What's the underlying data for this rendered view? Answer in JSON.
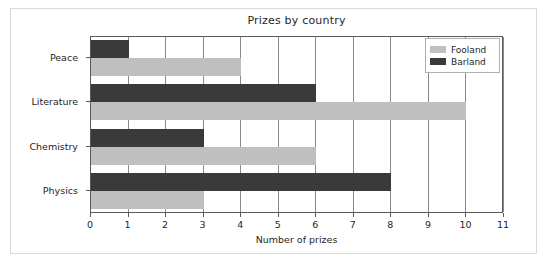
{
  "figure": {
    "title": "Prizes by country",
    "background_color": "#ffffff",
    "border_color": "#d9d9d9"
  },
  "legend": {
    "position": "upper right",
    "entries": [
      {
        "label": "Fooland",
        "color": "#bfbfbf"
      },
      {
        "label": "Barland",
        "color": "#3a3a3a"
      }
    ]
  },
  "axes": {
    "xlabel": "Number of prizes",
    "xticks": [
      "0",
      "1",
      "2",
      "3",
      "4",
      "5",
      "6",
      "7",
      "8",
      "9",
      "10",
      "11"
    ],
    "yticks": [
      "Peace",
      "Literature",
      "Chemistry",
      "Physics"
    ],
    "grid": "vertical",
    "gridline_color": "#8a8a8a",
    "spine_color": "#5a5a5a"
  },
  "chart_data": {
    "type": "bar",
    "orientation": "horizontal",
    "title": "Prizes by country",
    "xlabel": "Number of prizes",
    "ylabel": "",
    "categories": [
      "Peace",
      "Literature",
      "Chemistry",
      "Physics"
    ],
    "series": [
      {
        "name": "Fooland",
        "color": "#bfbfbf",
        "values": [
          4,
          10,
          6,
          3
        ]
      },
      {
        "name": "Barland",
        "color": "#3a3a3a",
        "values": [
          1,
          6,
          3,
          8
        ]
      }
    ],
    "xlim": [
      0,
      11
    ],
    "xtick_step": 1,
    "grid": true,
    "legend_position": "upper right"
  }
}
